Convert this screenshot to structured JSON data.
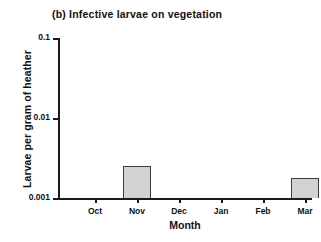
{
  "figure": {
    "panel_label": "(b)",
    "title": "(b) Infective larvae on vegetation",
    "background_color": "#ffffff"
  },
  "chart_data": {
    "type": "bar",
    "title": "(b) Infective larvae on vegetation",
    "xlabel": "Month",
    "ylabel": "Larvae per gram of heather",
    "categories": [
      "Oct",
      "Nov",
      "Dec",
      "Jan",
      "Feb",
      "Mar"
    ],
    "values": [
      0,
      0.0025,
      0,
      0,
      0,
      0.0018
    ],
    "series": [
      {
        "name": "Infective larvae on vegetation",
        "values": [
          0,
          0.0025,
          0,
          0,
          0,
          0.0018
        ]
      }
    ],
    "yscale": "log",
    "ylim": [
      0.001,
      0.1
    ],
    "ytick_labels": [
      "0.1",
      "0.01",
      "0.001"
    ],
    "ytick_values": [
      0.1,
      0.01,
      0.001
    ],
    "xtick_labels": [
      "Oct",
      "Nov",
      "Dec",
      "Jan",
      "Feb",
      "Mar"
    ],
    "grid": false,
    "legend": false,
    "bar_fill_color": "#d2d2d2",
    "bar_edge_color": "#3a3a3a",
    "axis_color": "#1a1a1a"
  },
  "axes": {
    "y": {
      "label": "Larvae per gram of heather",
      "ticks": [
        {
          "label": "0.1",
          "value": 0.1
        },
        {
          "label": "0.01",
          "value": 0.01
        },
        {
          "label": "0.001",
          "value": 0.001
        }
      ]
    },
    "x": {
      "label": "Month",
      "ticks": [
        {
          "label": "Oct"
        },
        {
          "label": "Nov"
        },
        {
          "label": "Dec"
        },
        {
          "label": "Jan"
        },
        {
          "label": "Feb"
        },
        {
          "label": "Mar"
        }
      ]
    }
  }
}
